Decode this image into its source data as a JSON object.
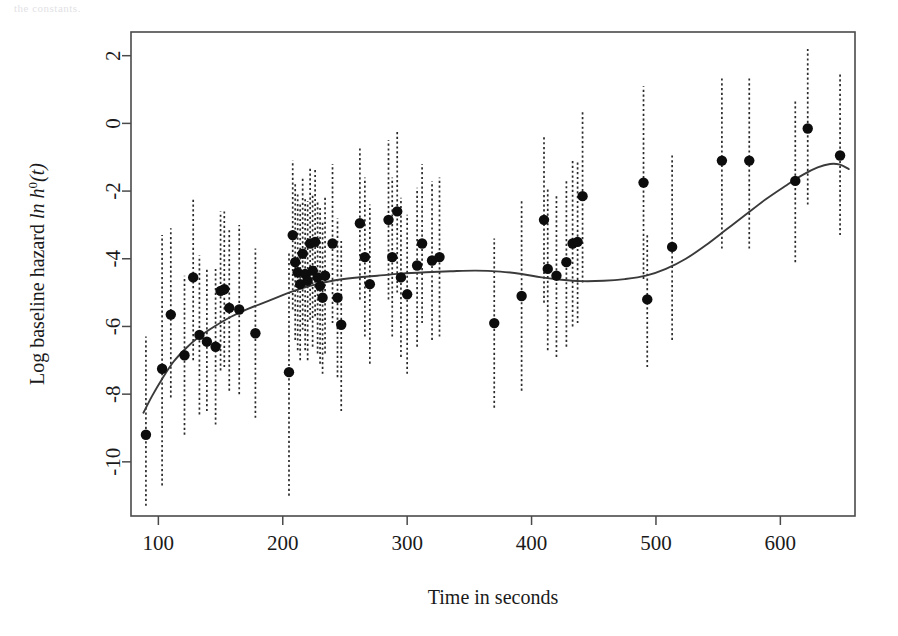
{
  "figure": {
    "top_artifact_text": "the constants.",
    "background_color": "#ffffff",
    "point_color": "#0d0d0d",
    "line_color": "#3a3a3a",
    "errorbar_color": "#2b2b2b",
    "axis_color": "#4a4a4a"
  },
  "chart_data": {
    "type": "scatter",
    "title": "",
    "xlabel": "Time in seconds",
    "ylabel": "Log baseline hazard  ln h⁰(t)",
    "xlim": [
      78,
      660
    ],
    "ylim": [
      -11.6,
      2.7
    ],
    "xticks": [
      100,
      200,
      300,
      400,
      500,
      600
    ],
    "yticks": [
      2,
      0,
      -2,
      -4,
      -6,
      -8,
      -10
    ],
    "xtick_labels": [
      "100",
      "200",
      "300",
      "400",
      "500",
      "600"
    ],
    "ytick_labels": [
      "2",
      "0",
      "-2",
      "-4",
      "-6",
      "-8",
      "-10"
    ],
    "grid": false,
    "legend": null,
    "series": [
      {
        "name": "Estimated log baseline hazard",
        "marker": "filled-circle",
        "errorbar_style": "dotted-vertical",
        "points": [
          {
            "x": 90,
            "y": -9.2,
            "lo": -11.3,
            "hi": -6.3
          },
          {
            "x": 103,
            "y": -7.25,
            "lo": -10.7,
            "hi": -3.3
          },
          {
            "x": 110,
            "y": -5.65,
            "lo": -8.1,
            "hi": -3.1
          },
          {
            "x": 121,
            "y": -6.85,
            "lo": -9.2,
            "hi": -4.5
          },
          {
            "x": 128,
            "y": -4.55,
            "lo": -7.0,
            "hi": -2.2
          },
          {
            "x": 133,
            "y": -6.25,
            "lo": -8.6,
            "hi": -3.9
          },
          {
            "x": 139,
            "y": -6.45,
            "lo": -8.5,
            "hi": -4.3
          },
          {
            "x": 146,
            "y": -6.6,
            "lo": -8.9,
            "hi": -4.3
          },
          {
            "x": 150,
            "y": -4.95,
            "lo": -7.3,
            "hi": -2.6
          },
          {
            "x": 153,
            "y": -4.9,
            "lo": -7.2,
            "hi": -2.6
          },
          {
            "x": 157,
            "y": -5.45,
            "lo": -7.9,
            "hi": -3.1
          },
          {
            "x": 165,
            "y": -5.5,
            "lo": -8.0,
            "hi": -3.0
          },
          {
            "x": 178,
            "y": -6.2,
            "lo": -8.7,
            "hi": -3.7
          },
          {
            "x": 205,
            "y": -7.35,
            "lo": -11.0,
            "hi": -3.8
          },
          {
            "x": 208,
            "y": -3.3,
            "lo": -5.5,
            "hi": -1.1
          },
          {
            "x": 210,
            "y": -4.1,
            "lo": -6.4,
            "hi": -1.8
          },
          {
            "x": 212,
            "y": -4.4,
            "lo": -6.7,
            "hi": -2.1
          },
          {
            "x": 214,
            "y": -4.75,
            "lo": -7.0,
            "hi": -2.4
          },
          {
            "x": 216,
            "y": -3.85,
            "lo": -6.1,
            "hi": -1.6
          },
          {
            "x": 218,
            "y": -4.45,
            "lo": -6.7,
            "hi": -2.2
          },
          {
            "x": 220,
            "y": -4.65,
            "lo": -7.0,
            "hi": -2.3
          },
          {
            "x": 222,
            "y": -3.55,
            "lo": -5.8,
            "hi": -1.3
          },
          {
            "x": 224,
            "y": -4.35,
            "lo": -6.6,
            "hi": -2.1
          },
          {
            "x": 226,
            "y": -3.5,
            "lo": -5.7,
            "hi": -1.3
          },
          {
            "x": 228,
            "y": -4.55,
            "lo": -6.8,
            "hi": -2.3
          },
          {
            "x": 230,
            "y": -4.8,
            "lo": -7.1,
            "hi": -2.5
          },
          {
            "x": 232,
            "y": -5.15,
            "lo": -7.4,
            "hi": -2.9
          },
          {
            "x": 234,
            "y": -4.5,
            "lo": -6.8,
            "hi": -2.2
          },
          {
            "x": 240,
            "y": -3.55,
            "lo": -5.9,
            "hi": -1.2
          },
          {
            "x": 244,
            "y": -5.15,
            "lo": -7.5,
            "hi": -2.8
          },
          {
            "x": 247,
            "y": -5.95,
            "lo": -8.5,
            "hi": -3.4
          },
          {
            "x": 262,
            "y": -2.95,
            "lo": -5.2,
            "hi": -0.7
          },
          {
            "x": 266,
            "y": -3.95,
            "lo": -6.3,
            "hi": -1.6
          },
          {
            "x": 270,
            "y": -4.75,
            "lo": -7.1,
            "hi": -2.4
          },
          {
            "x": 285,
            "y": -2.85,
            "lo": -5.2,
            "hi": -0.5
          },
          {
            "x": 288,
            "y": -3.95,
            "lo": -6.3,
            "hi": -1.6
          },
          {
            "x": 292,
            "y": -2.6,
            "lo": -5.0,
            "hi": -0.2
          },
          {
            "x": 295,
            "y": -4.55,
            "lo": -6.9,
            "hi": -2.2
          },
          {
            "x": 300,
            "y": -5.05,
            "lo": -7.4,
            "hi": -2.7
          },
          {
            "x": 308,
            "y": -4.2,
            "lo": -6.6,
            "hi": -1.9
          },
          {
            "x": 312,
            "y": -3.55,
            "lo": -5.9,
            "hi": -1.2
          },
          {
            "x": 320,
            "y": -4.05,
            "lo": -6.4,
            "hi": -1.7
          },
          {
            "x": 326,
            "y": -3.95,
            "lo": -6.3,
            "hi": -1.6
          },
          {
            "x": 370,
            "y": -5.9,
            "lo": -8.4,
            "hi": -3.4
          },
          {
            "x": 392,
            "y": -5.1,
            "lo": -7.9,
            "hi": -2.3
          },
          {
            "x": 410,
            "y": -2.85,
            "lo": -5.3,
            "hi": -0.4
          },
          {
            "x": 413,
            "y": -4.3,
            "lo": -6.7,
            "hi": -1.9
          },
          {
            "x": 420,
            "y": -4.5,
            "lo": -6.9,
            "hi": -2.1
          },
          {
            "x": 428,
            "y": -4.1,
            "lo": -6.6,
            "hi": -1.7
          },
          {
            "x": 433,
            "y": -3.55,
            "lo": -6.0,
            "hi": -1.1
          },
          {
            "x": 437,
            "y": -3.5,
            "lo": -5.9,
            "hi": -1.1
          },
          {
            "x": 441,
            "y": -2.15,
            "lo": -4.7,
            "hi": 0.4
          },
          {
            "x": 490,
            "y": -1.75,
            "lo": -4.6,
            "hi": 1.1
          },
          {
            "x": 493,
            "y": -5.2,
            "lo": -7.2,
            "hi": -3.3
          },
          {
            "x": 513,
            "y": -3.65,
            "lo": -6.4,
            "hi": -0.9
          },
          {
            "x": 553,
            "y": -1.1,
            "lo": -3.7,
            "hi": 1.4
          },
          {
            "x": 575,
            "y": -1.1,
            "lo": -3.7,
            "hi": 1.4
          },
          {
            "x": 612,
            "y": -1.7,
            "lo": -4.1,
            "hi": 0.7
          },
          {
            "x": 622,
            "y": -0.15,
            "lo": -2.4,
            "hi": 2.2
          },
          {
            "x": 648,
            "y": -0.95,
            "lo": -3.3,
            "hi": 1.5
          }
        ]
      }
    ],
    "fit_line": {
      "name": "Smoothed baseline hazard fit",
      "style": "solid",
      "points": [
        {
          "x": 88,
          "y": -8.55
        },
        {
          "x": 95,
          "y": -8.05
        },
        {
          "x": 103,
          "y": -7.55
        },
        {
          "x": 112,
          "y": -7.05
        },
        {
          "x": 122,
          "y": -6.65
        },
        {
          "x": 133,
          "y": -6.3
        },
        {
          "x": 145,
          "y": -6.0
        },
        {
          "x": 158,
          "y": -5.72
        },
        {
          "x": 172,
          "y": -5.48
        },
        {
          "x": 188,
          "y": -5.25
        },
        {
          "x": 205,
          "y": -5.0
        },
        {
          "x": 222,
          "y": -4.8
        },
        {
          "x": 240,
          "y": -4.65
        },
        {
          "x": 258,
          "y": -4.56
        },
        {
          "x": 276,
          "y": -4.5
        },
        {
          "x": 295,
          "y": -4.44
        },
        {
          "x": 315,
          "y": -4.4
        },
        {
          "x": 335,
          "y": -4.37
        },
        {
          "x": 355,
          "y": -4.35
        },
        {
          "x": 375,
          "y": -4.38
        },
        {
          "x": 392,
          "y": -4.45
        },
        {
          "x": 408,
          "y": -4.55
        },
        {
          "x": 424,
          "y": -4.62
        },
        {
          "x": 440,
          "y": -4.66
        },
        {
          "x": 458,
          "y": -4.65
        },
        {
          "x": 475,
          "y": -4.6
        },
        {
          "x": 492,
          "y": -4.5
        },
        {
          "x": 508,
          "y": -4.3
        },
        {
          "x": 524,
          "y": -4.0
        },
        {
          "x": 540,
          "y": -3.6
        },
        {
          "x": 556,
          "y": -3.15
        },
        {
          "x": 572,
          "y": -2.7
        },
        {
          "x": 588,
          "y": -2.25
        },
        {
          "x": 604,
          "y": -1.85
        },
        {
          "x": 618,
          "y": -1.52
        },
        {
          "x": 630,
          "y": -1.3
        },
        {
          "x": 640,
          "y": -1.2
        },
        {
          "x": 648,
          "y": -1.22
        },
        {
          "x": 655,
          "y": -1.35
        }
      ]
    }
  }
}
